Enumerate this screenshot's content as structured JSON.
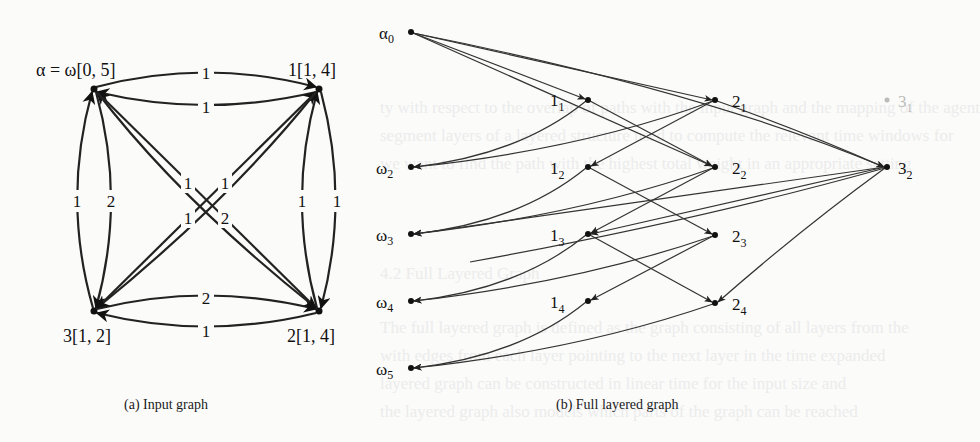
{
  "figure": {
    "subfigure_a": {
      "caption": "(a) Input graph",
      "nodes": [
        {
          "id": "alpha",
          "label": "α = ω[0, 5]"
        },
        {
          "id": "1",
          "label": "1[1, 4]"
        },
        {
          "id": "2",
          "label": "2[1, 4]"
        },
        {
          "id": "3",
          "label": "3[1, 2]"
        }
      ],
      "edge_weights": {
        "top_upper": "1",
        "top_lower": "1",
        "bottom_upper": "2",
        "bottom_lower": "1",
        "left_outer": "1",
        "left_inner": "2",
        "right_inner": "1",
        "right_outer": "1",
        "diag_top_left": "1",
        "diag_top_right": "1",
        "diag_bottom_left": "1",
        "diag_bottom_right": "2"
      }
    },
    "subfigure_b": {
      "caption": "(b) Full layered graph",
      "layer0": [
        {
          "id": "a0",
          "base": "α",
          "sub": "0"
        },
        {
          "id": "w2",
          "base": "ω",
          "sub": "2"
        },
        {
          "id": "w3",
          "base": "ω",
          "sub": "3"
        },
        {
          "id": "w4",
          "base": "ω",
          "sub": "4"
        },
        {
          "id": "w5",
          "base": "ω",
          "sub": "5"
        }
      ],
      "layer1": [
        {
          "id": "1_1",
          "base": "1",
          "sub": "1"
        },
        {
          "id": "1_2",
          "base": "1",
          "sub": "2"
        },
        {
          "id": "1_3",
          "base": "1",
          "sub": "3"
        },
        {
          "id": "1_4",
          "base": "1",
          "sub": "4"
        }
      ],
      "layer2": [
        {
          "id": "2_1",
          "base": "2",
          "sub": "1"
        },
        {
          "id": "2_2",
          "base": "2",
          "sub": "2"
        },
        {
          "id": "2_3",
          "base": "2",
          "sub": "3"
        },
        {
          "id": "2_4",
          "base": "2",
          "sub": "4"
        }
      ],
      "layer3": [
        {
          "id": "3_1",
          "base": "3",
          "sub": "1",
          "faded": true
        },
        {
          "id": "3_2",
          "base": "3",
          "sub": "2"
        }
      ]
    }
  }
}
